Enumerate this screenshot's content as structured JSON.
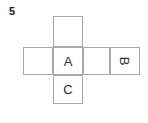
{
  "figure": {
    "problem_number": "5",
    "kind": "cube-net",
    "line_color": "#a9a9a9",
    "text_color": "#2b2b2b",
    "background_color": "#ffffff",
    "cells": [
      {
        "id": "top",
        "label": "",
        "rotation": 0,
        "x": 53,
        "y": 16,
        "width": 30,
        "height": 31
      },
      {
        "id": "row-left",
        "label": "",
        "rotation": 0,
        "x": 23,
        "y": 47,
        "width": 30,
        "height": 28
      },
      {
        "id": "center-a",
        "label": "A",
        "rotation": 0,
        "x": 53,
        "y": 47,
        "width": 30,
        "height": 28
      },
      {
        "id": "row-right-1",
        "label": "",
        "rotation": 0,
        "x": 83,
        "y": 47,
        "width": 27,
        "height": 28
      },
      {
        "id": "row-right-2-b",
        "label": "B",
        "rotation": 90,
        "x": 110,
        "y": 47,
        "width": 30,
        "height": 28
      },
      {
        "id": "bottom-c",
        "label": "C",
        "rotation": 0,
        "x": 53,
        "y": 75,
        "width": 30,
        "height": 29
      }
    ]
  }
}
